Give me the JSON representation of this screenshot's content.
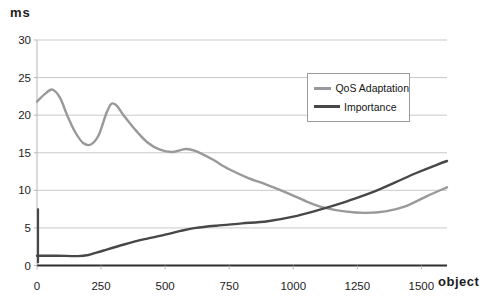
{
  "chart": {
    "y_unit_label": "ms",
    "x_unit_label": "object"
  },
  "colors": {
    "background": "#ffffff",
    "gridline": "#c9c9c9",
    "axis_dark": "#2e2e2e",
    "axis_light": "#b7b7b7",
    "tick_text": "#1c1c1c",
    "legend_border": "#9a9a9a"
  },
  "chart_data": {
    "type": "line",
    "title": "",
    "xlabel": "object",
    "ylabel": "ms",
    "xlim": [
      0,
      1600
    ],
    "ylim": [
      0,
      30
    ],
    "x_ticks": [
      0,
      250,
      500,
      750,
      1000,
      1250,
      1500
    ],
    "y_ticks": [
      0,
      5,
      10,
      15,
      20,
      25,
      30
    ],
    "grid": "horizontal",
    "legend_position": "inside-upper-right",
    "series": [
      {
        "name": "QoS Adaptation",
        "color": "#97999b",
        "width": 2.4,
        "points": [
          [
            0,
            21.8
          ],
          [
            30,
            22.8
          ],
          [
            60,
            23.4
          ],
          [
            90,
            22.3
          ],
          [
            120,
            19.8
          ],
          [
            150,
            17.7
          ],
          [
            180,
            16.3
          ],
          [
            210,
            16.1
          ],
          [
            240,
            17.3
          ],
          [
            270,
            20.2
          ],
          [
            290,
            21.5
          ],
          [
            310,
            21.3
          ],
          [
            340,
            19.9
          ],
          [
            380,
            18.2
          ],
          [
            430,
            16.4
          ],
          [
            480,
            15.4
          ],
          [
            530,
            15.1
          ],
          [
            580,
            15.5
          ],
          [
            620,
            15.2
          ],
          [
            680,
            14.2
          ],
          [
            750,
            12.8
          ],
          [
            820,
            11.7
          ],
          [
            900,
            10.7
          ],
          [
            980,
            9.6
          ],
          [
            1060,
            8.4
          ],
          [
            1120,
            7.7
          ],
          [
            1200,
            7.2
          ],
          [
            1280,
            7.0
          ],
          [
            1360,
            7.2
          ],
          [
            1440,
            7.9
          ],
          [
            1520,
            9.2
          ],
          [
            1600,
            10.4
          ]
        ]
      },
      {
        "name": "Importance",
        "color": "#474747",
        "width": 2.4,
        "points": [
          [
            0,
            1.3
          ],
          [
            80,
            1.3
          ],
          [
            160,
            1.25
          ],
          [
            200,
            1.4
          ],
          [
            260,
            2.0
          ],
          [
            340,
            2.8
          ],
          [
            420,
            3.5
          ],
          [
            500,
            4.1
          ],
          [
            560,
            4.6
          ],
          [
            620,
            5.0
          ],
          [
            700,
            5.3
          ],
          [
            800,
            5.6
          ],
          [
            900,
            5.9
          ],
          [
            1000,
            6.5
          ],
          [
            1080,
            7.2
          ],
          [
            1160,
            8.0
          ],
          [
            1240,
            8.9
          ],
          [
            1320,
            9.9
          ],
          [
            1400,
            11.1
          ],
          [
            1480,
            12.3
          ],
          [
            1560,
            13.4
          ],
          [
            1600,
            13.9
          ]
        ]
      }
    ],
    "axis_spike": {
      "x": 0,
      "y_from": 0.3,
      "y_to": 7.6,
      "color": "#474747"
    }
  }
}
